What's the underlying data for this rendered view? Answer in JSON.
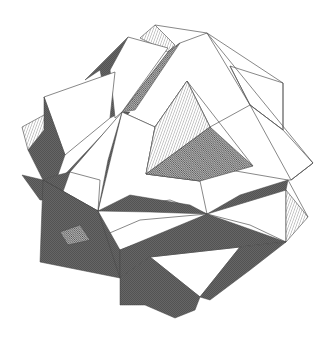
{
  "figure": {
    "style": "monochrome engraving with hatched shaded faces",
    "colors": {
      "background": "#ffffff",
      "line": "#555555",
      "hatch": "#333333"
    },
    "width": 333,
    "height": 339
  }
}
